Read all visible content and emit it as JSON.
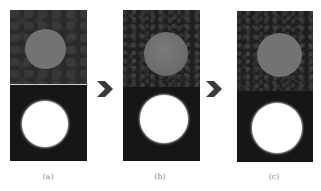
{
  "figure": {
    "panels": [
      {
        "id": "a",
        "label": "(a)",
        "top_image": "gray circle on textured dark background",
        "bottom_image": "white circle on dark background (binary mask)"
      },
      {
        "id": "b",
        "label": "(b)",
        "top_image": "gray circle on textured dark background",
        "bottom_image": "white circle on dark background (binary mask)"
      },
      {
        "id": "c",
        "label": "(c)",
        "top_image": "gray circle on textured dark background",
        "bottom_image": "white circle on dark background (binary mask)"
      }
    ],
    "arrows": [
      {
        "from": "a",
        "to": "b",
        "icon": "chevron-right-icon"
      },
      {
        "from": "b",
        "to": "c",
        "icon": "chevron-right-icon"
      }
    ],
    "colors": {
      "background": "#ffffff",
      "panel_dark": "#1f1f1f",
      "circle_gray": "#737373",
      "circle_white": "#ffffff",
      "arrow": "#3a3a3a",
      "label_text": "#8a8a8a"
    }
  }
}
